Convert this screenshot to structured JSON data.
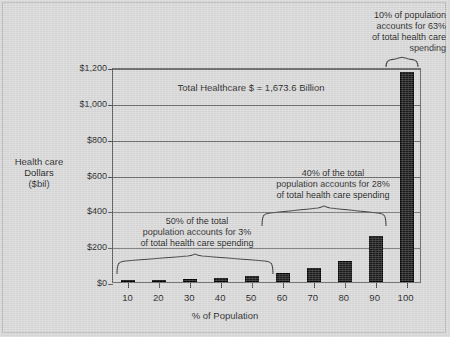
{
  "chart_data": {
    "type": "bar",
    "title": "",
    "xlabel": "% of Population",
    "ylabel": "Health care\nDollars\n($bil)",
    "ylabel_lines": [
      "Health care",
      "Dollars",
      "($bil)"
    ],
    "categories": [
      "10",
      "20",
      "30",
      "40",
      "50",
      "60",
      "70",
      "80",
      "90",
      "100"
    ],
    "values": [
      8,
      14,
      17,
      22,
      33,
      48,
      78,
      120,
      258,
      1170
    ],
    "ylim": [
      0,
      1200
    ],
    "yticks": [
      0,
      200,
      400,
      600,
      800,
      1000,
      1200
    ],
    "ytick_labels": [
      "$0",
      "$200",
      "$400",
      "$600",
      "$800",
      "$1,000",
      "$1,200"
    ],
    "grid": true,
    "legend": "none",
    "bar_color": "#1b1b1b",
    "background_color": "#d9d9d9",
    "annotations": [
      {
        "id": "total-healthcare",
        "text": "Total Healthcare $ = 1,673.6 Billion"
      },
      {
        "id": "top-10-percent",
        "text": "10% of population\naccounts for 63%\nof total health care\nspending",
        "bracket_categories": [
          "100"
        ]
      },
      {
        "id": "middle-40-percent",
        "text": "40% of the total\npopulation accounts for 28%\nof total health care spending",
        "bracket_categories": [
          "60",
          "70",
          "80",
          "90"
        ]
      },
      {
        "id": "bottom-50-percent",
        "text": "50% of the total\npopulation accounts for 3%\nof total health care spending",
        "bracket_categories": [
          "10",
          "20",
          "30",
          "40",
          "50"
        ]
      }
    ]
  }
}
